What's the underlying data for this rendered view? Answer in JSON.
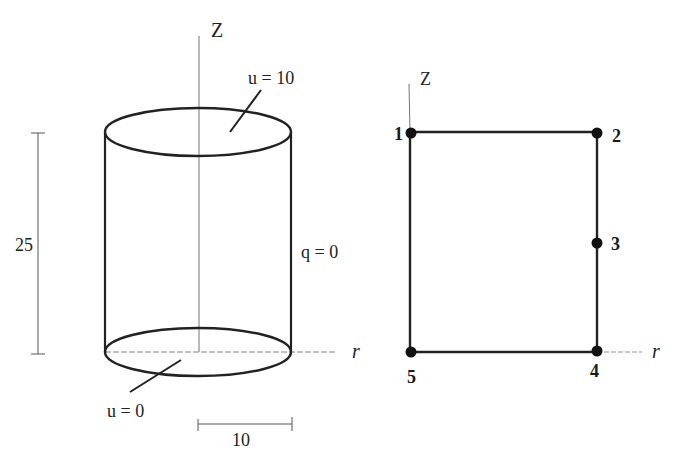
{
  "colors": {
    "ink": "#222222",
    "thin_line": "#555555",
    "background": "#ffffff"
  },
  "left_figure": {
    "axis_z_label": "Z",
    "axis_r_label": "r",
    "top_boundary_label": "u = 10",
    "bottom_boundary_label": "u = 0",
    "side_boundary_label": "q = 0",
    "height_dimension_label": "25",
    "radius_dimension_label": "10"
  },
  "right_figure": {
    "axis_z_label": "Z",
    "axis_r_label": "r",
    "nodes": [
      {
        "id": "1",
        "x": 411,
        "y": 132
      },
      {
        "id": "2",
        "x": 597,
        "y": 132
      },
      {
        "id": "3",
        "x": 597,
        "y": 243
      },
      {
        "id": "4",
        "x": 597,
        "y": 352
      },
      {
        "id": "5",
        "x": 411,
        "y": 352
      }
    ]
  }
}
